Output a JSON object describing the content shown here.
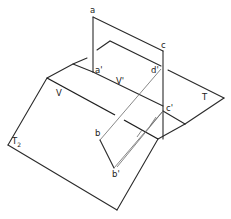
{
  "diagram": {
    "labels": {
      "a": "a",
      "a_prime": "a'",
      "c": "c",
      "c_prime": "c'",
      "d_prime": "d'",
      "b": "b",
      "b_prime": "b'",
      "V": "V",
      "V_prime": "V'",
      "T": "T",
      "T2_main": "T",
      "T2_sub": "2"
    },
    "colors": {
      "line": "#2a2a2a",
      "thin_line": "#6a6a6a",
      "background": "#ffffff"
    }
  }
}
